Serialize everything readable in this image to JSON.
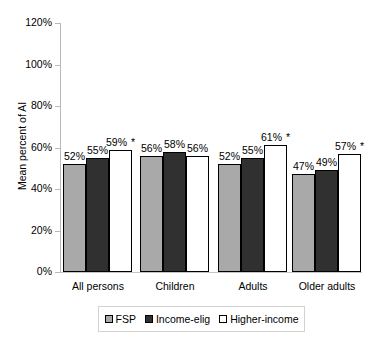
{
  "chart_data": {
    "type": "bar",
    "title": "",
    "subtitle": "",
    "xlabel": "",
    "ylabel": "Mean percent of AI",
    "ylim": [
      0,
      120
    ],
    "y_unit": "%",
    "grid": false,
    "legend_position": "bottom",
    "categories": [
      "All persons",
      "Children",
      "Adults",
      "Older adults"
    ],
    "y_ticks": [
      "0%",
      "20%",
      "40%",
      "60%",
      "80%",
      "100%",
      "120%"
    ],
    "y_tick_values": [
      0,
      20,
      40,
      60,
      80,
      100,
      120
    ],
    "series": [
      {
        "name": "FSP",
        "color": "#a9a9a9",
        "values": [
          52,
          56,
          52,
          47
        ],
        "labels": [
          "52%",
          "56%",
          "52%",
          "47%"
        ],
        "significance": [
          "",
          "",
          "",
          ""
        ]
      },
      {
        "name": "Income-elig",
        "color": "#303030",
        "values": [
          55,
          58,
          55,
          49
        ],
        "labels": [
          "55%",
          "58%",
          "55%",
          "49%"
        ],
        "significance": [
          "",
          "",
          "",
          ""
        ]
      },
      {
        "name": "Higher-income",
        "color": "#ffffff",
        "values": [
          59,
          56,
          61,
          57
        ],
        "labels": [
          "59%",
          "56%",
          "61%",
          "57%"
        ],
        "significance": [
          "*",
          "",
          "*",
          "*"
        ]
      }
    ],
    "annotations": [
      "*"
    ]
  },
  "legend": {
    "items": [
      {
        "label": "FSP",
        "swatch": "series-fsp"
      },
      {
        "label": "Income-elig",
        "swatch": "series-income"
      },
      {
        "label": "Higher-income",
        "swatch": "series-higher"
      }
    ]
  }
}
